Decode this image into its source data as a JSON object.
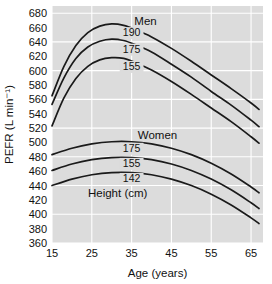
{
  "chart_data": {
    "type": "line",
    "title": "",
    "subtitle": "",
    "xlabel": "Age (years)",
    "ylabel": "PEFR (L min⁻¹)",
    "xlim": [
      15,
      68
    ],
    "ylim": [
      360,
      690
    ],
    "xticks": [
      15,
      25,
      35,
      45,
      55,
      65
    ],
    "yticks": [
      360,
      380,
      400,
      420,
      440,
      460,
      480,
      500,
      520,
      540,
      560,
      580,
      600,
      620,
      640,
      660,
      680
    ],
    "xtick_labels": [
      "15",
      "25",
      "35",
      "45",
      "55",
      "65"
    ],
    "ytick_labels": [
      "360",
      "380",
      "400",
      "420",
      "440",
      "460",
      "480",
      "500",
      "520",
      "540",
      "560",
      "580",
      "600",
      "620",
      "640",
      "660",
      "680"
    ],
    "grid": true,
    "grid_color": "#ffffff",
    "plot_background": "#dcdcdc",
    "line_color": "#1a1a1a",
    "legend_position": "inline-annotations",
    "annotations": [
      {
        "text": "Men",
        "x": 38.5,
        "y": 663
      },
      {
        "text": "Women",
        "x": 41.5,
        "y": 505
      },
      {
        "text": "Height (cm)",
        "x": 31.5,
        "y": 424
      }
    ],
    "group_labels": [
      "Men",
      "Women"
    ],
    "height_caption": "Height (cm)",
    "series": [
      {
        "name": "Men 190 cm",
        "group": "Men",
        "height_cm": 190,
        "label": "190",
        "label_x": 35.0,
        "label_y": 648,
        "x": [
          15,
          18,
          21,
          24,
          27,
          30,
          33,
          36,
          40,
          45,
          50,
          55,
          60,
          65,
          67
        ],
        "values": [
          565,
          606,
          635,
          653,
          662,
          665,
          663,
          657,
          647,
          631,
          613,
          594,
          575,
          555,
          546
        ]
      },
      {
        "name": "Men 175 cm",
        "group": "Men",
        "height_cm": 175,
        "label": "175",
        "label_x": 35.0,
        "label_y": 625,
        "x": [
          15,
          18,
          21,
          24,
          27,
          30,
          33,
          36,
          40,
          45,
          50,
          55,
          60,
          65,
          67
        ],
        "values": [
          553,
          590,
          617,
          633,
          641,
          644,
          642,
          636,
          626,
          609,
          591,
          571,
          552,
          531,
          522
        ]
      },
      {
        "name": "Men 155 cm",
        "group": "Men",
        "height_cm": 155,
        "label": "155",
        "label_x": 35.0,
        "label_y": 601,
        "x": [
          15,
          18,
          21,
          24,
          27,
          30,
          33,
          36,
          40,
          45,
          50,
          55,
          60,
          65,
          67
        ],
        "values": [
          523,
          562,
          589,
          606,
          615,
          618,
          617,
          611,
          601,
          585,
          567,
          548,
          529,
          508,
          499
        ]
      },
      {
        "name": "Women 175 cm",
        "group": "Women",
        "height_cm": 175,
        "label": "175",
        "label_x": 35.0,
        "label_y": 487,
        "x": [
          15,
          20,
          25,
          30,
          35,
          40,
          45,
          50,
          55,
          60,
          65,
          67
        ],
        "values": [
          483,
          492,
          498,
          501,
          501,
          498,
          492,
          483,
          471,
          456,
          438,
          430
        ]
      },
      {
        "name": "Women 155 cm",
        "group": "Women",
        "height_cm": 155,
        "label": "155",
        "label_x": 35.0,
        "label_y": 466,
        "x": [
          15,
          20,
          25,
          30,
          35,
          40,
          45,
          50,
          55,
          60,
          65,
          67
        ],
        "values": [
          461,
          470,
          476,
          479,
          479,
          476,
          470,
          461,
          449,
          434,
          416,
          408
        ]
      },
      {
        "name": "Women 142 cm",
        "group": "Women",
        "height_cm": 142,
        "label": "142",
        "label_x": 35.0,
        "label_y": 445,
        "x": [
          15,
          20,
          25,
          30,
          35,
          40,
          45,
          50,
          55,
          60,
          65,
          67
        ],
        "values": [
          440,
          449,
          455,
          458,
          458,
          455,
          449,
          440,
          428,
          413,
          395,
          387
        ]
      }
    ]
  }
}
